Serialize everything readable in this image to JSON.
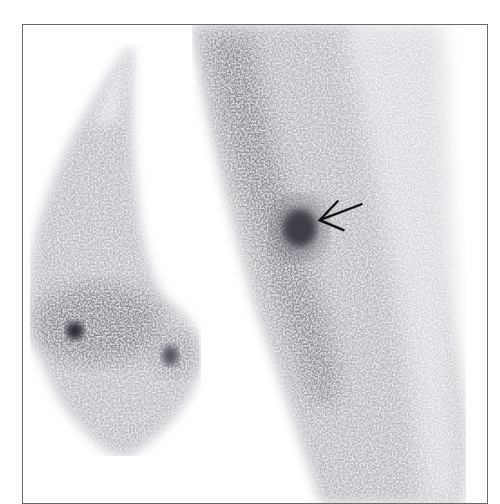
{
  "image": {
    "type": "scintigraphy",
    "description": "Grayscale nuclear medicine scan with two anatomical regions and a focal hot spot indicated by an arrow",
    "frame_color": "#6a6a6a",
    "background": "#ffffff",
    "uptake_color": "#2a2a38"
  },
  "regions": [
    {
      "name": "left-structure",
      "label": ""
    },
    {
      "name": "right-elongated-structure",
      "label": ""
    }
  ],
  "annotations": [
    {
      "type": "arrow",
      "target": "focal-hot-spot",
      "direction": "pointing-left",
      "color": "#111111"
    }
  ]
}
